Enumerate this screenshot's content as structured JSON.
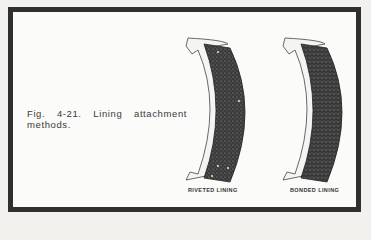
{
  "figure": {
    "caption": "Fig. 4-21. Lining attachment methods.",
    "illustrations": [
      {
        "label": "RIVETED LINING",
        "type": "riveted"
      },
      {
        "label": "BONDED LINING",
        "type": "bonded"
      }
    ]
  },
  "colors": {
    "border": "#2f2f2f",
    "lining": "#3a3a3a",
    "background": "#fbfbf9"
  }
}
